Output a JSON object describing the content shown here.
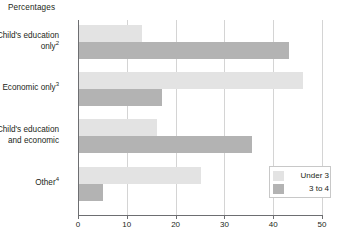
{
  "chart_data": {
    "type": "bar",
    "orientation": "horizontal",
    "title": "Percentages",
    "xlabel": "",
    "ylabel": "",
    "xlim": [
      0,
      50
    ],
    "xticks": [
      0,
      10,
      20,
      30,
      40,
      50
    ],
    "xtick_labels": [
      "0",
      "10",
      "20",
      "30",
      "40",
      "50"
    ],
    "grid": "vertical",
    "legend_position": "bottom-right",
    "categories": [
      "Child's education only2",
      "Economic only3",
      "Child's education and economic",
      "Other4"
    ],
    "category_labels": [
      {
        "line1": "Child's education",
        "line2": "only",
        "note": "2"
      },
      {
        "line1": "Economic only",
        "line2": "",
        "note": "3"
      },
      {
        "line1": "Child's education",
        "line2": "and economic",
        "note": ""
      },
      {
        "line1": "Other",
        "line2": "",
        "note": "4"
      }
    ],
    "series": [
      {
        "name": "Under 3",
        "color": "#e3e3e3",
        "values": [
          13,
          46,
          16,
          25
        ]
      },
      {
        "name": "3 to 4",
        "color": "#b3b3b3",
        "values": [
          43,
          17,
          35.5,
          5
        ]
      }
    ]
  },
  "legend": {
    "items": [
      {
        "label": "Under 3",
        "color": "#e3e3e3"
      },
      {
        "label": "3 to 4",
        "color": "#b3b3b3"
      }
    ]
  },
  "colors": {
    "under3": "#e3e3e3",
    "three_to_four": "#b3b3b3",
    "axis": "#6d6e71",
    "gridline": "#d4d4d4",
    "text": "#231f20",
    "background": "#ffffff"
  }
}
